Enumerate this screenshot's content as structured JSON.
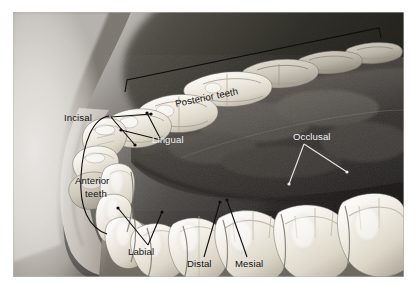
{
  "figure": {
    "kind": "anatomical-illustration",
    "background_color": "#8a8a8a",
    "page_background": "#ffffff",
    "border_color": "#ffffff",
    "color_mode": "grayscale",
    "palette": {
      "tooth_highlight": "#fdfcf7",
      "tooth_mid": "#ddd8cd",
      "tooth_shadow": "#9d978b",
      "tongue_dark": "#2e2c2a",
      "tongue_mid": "#57524e",
      "lip_light": "#cfcac4",
      "gum": "#8f8880",
      "label_dark": "#101010",
      "label_light": "#f2f2f2"
    }
  },
  "labels": [
    {
      "id": "posterior-teeth",
      "text": "Posterior teeth",
      "color": "dark",
      "style": "rotated-bracket",
      "rotation_deg": -12,
      "x": 175,
      "y": 98,
      "anchor": "start"
    },
    {
      "id": "incisal",
      "text": "Incisal",
      "color": "dark",
      "style": "double-leader",
      "x": 64,
      "y": 109,
      "anchor": "start"
    },
    {
      "id": "lingual",
      "text": "Lingual",
      "color": "light",
      "style": "double-leader",
      "x": 152,
      "y": 131,
      "anchor": "start"
    },
    {
      "id": "occlusal",
      "text": "Occlusal",
      "color": "light",
      "style": "double-leader",
      "x": 293,
      "y": 127,
      "anchor": "start"
    },
    {
      "id": "anterior-teeth-line1",
      "text": "Anterior",
      "color": "dark",
      "style": "curved-leader",
      "x": 75,
      "y": 172,
      "anchor": "start"
    },
    {
      "id": "anterior-teeth-line2",
      "text": "teeth",
      "color": "dark",
      "style": "curved-leader",
      "x": 82,
      "y": 185,
      "anchor": "start"
    },
    {
      "id": "labial",
      "text": "Labial",
      "color": "dark",
      "style": "double-leader",
      "x": 128,
      "y": 243,
      "anchor": "start"
    },
    {
      "id": "distal",
      "text": "Distal",
      "color": "dark",
      "style": "single-leader",
      "x": 190,
      "y": 255,
      "anchor": "start"
    },
    {
      "id": "mesial",
      "text": "Mesial",
      "color": "dark",
      "style": "single-leader",
      "x": 234,
      "y": 255,
      "anchor": "start"
    }
  ]
}
